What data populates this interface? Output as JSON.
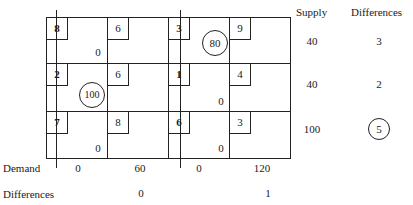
{
  "table": {
    "header": {
      "supply_label": "Supply",
      "differences_label": "Differences"
    },
    "rows": [
      {
        "cells": [
          {
            "cost": "8",
            "allocation": "0",
            "circled": false
          },
          {
            "cost": "6",
            "allocation": "",
            "circled": false
          },
          {
            "cost": "3",
            "allocation": "80",
            "circled": true
          },
          {
            "cost": "9",
            "allocation": "",
            "circled": false
          }
        ],
        "supply": "40",
        "difference": {
          "value": "3",
          "circled": false
        }
      },
      {
        "cells": [
          {
            "cost": "2",
            "allocation": "100",
            "circled": true
          },
          {
            "cost": "6",
            "allocation": "",
            "circled": false
          },
          {
            "cost": "1",
            "allocation": "0",
            "circled": false
          },
          {
            "cost": "4",
            "allocation": "",
            "circled": false
          }
        ],
        "supply": "40",
        "difference": {
          "value": "2",
          "circled": false
        }
      },
      {
        "cells": [
          {
            "cost": "7",
            "allocation": "0",
            "circled": false
          },
          {
            "cost": "8",
            "allocation": "",
            "circled": false
          },
          {
            "cost": "6",
            "allocation": "0",
            "circled": false
          },
          {
            "cost": "3",
            "allocation": "",
            "circled": false
          }
        ],
        "supply": "100",
        "difference": {
          "value": "5",
          "circled": true
        }
      }
    ],
    "demand": {
      "label": "Demand",
      "values": [
        "0",
        "60",
        "0",
        "120"
      ]
    },
    "column_differences": {
      "label": "Differences",
      "values": [
        "",
        "0",
        "",
        "1"
      ]
    },
    "crossed_columns": [
      1,
      3
    ]
  }
}
